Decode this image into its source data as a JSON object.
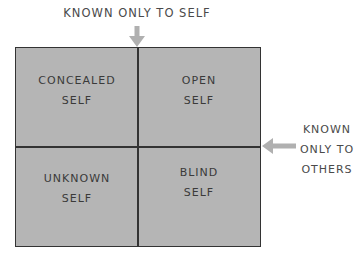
{
  "diagram": {
    "type": "johari-window",
    "top_label": "KNOWN ONLY TO SELF",
    "right_label": [
      "KNOWN",
      "ONLY TO",
      "OTHERS"
    ],
    "quadrants": [
      {
        "position": "top-left",
        "lines": [
          "CONCEALED",
          "SELF"
        ]
      },
      {
        "position": "top-right",
        "lines": [
          "OPEN",
          "SELF"
        ]
      },
      {
        "position": "bottom-left",
        "lines": [
          "UNKNOWN",
          "SELF"
        ]
      },
      {
        "position": "bottom-right",
        "lines": [
          "BLIND",
          "SELF"
        ]
      }
    ],
    "colors": {
      "fill": "#b5b5b5",
      "border": "#333333",
      "arrow": "#b0b0b0"
    }
  }
}
